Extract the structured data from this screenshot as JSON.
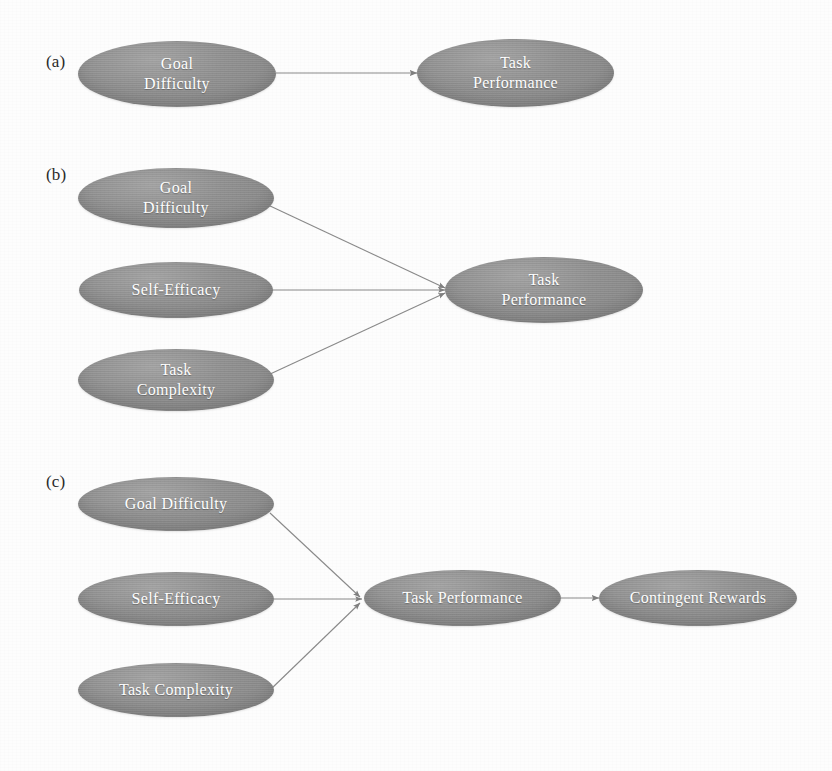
{
  "figure": {
    "background_color": "#fdfdfd",
    "node_fill_color": "#8d8d8d",
    "node_text_color": "#ffffff",
    "edge_color": "#8a8a8a",
    "panel_label_color": "#2a2a2a"
  },
  "panels": [
    {
      "label": "(a)",
      "nodes": [
        {
          "id": "a-goal-difficulty",
          "text": "Goal\nDifficulty"
        },
        {
          "id": "a-task-performance",
          "text": "Task\nPerformance"
        }
      ],
      "edges": [
        {
          "from": "Goal Difficulty",
          "to": "Task Performance"
        }
      ]
    },
    {
      "label": "(b)",
      "nodes": [
        {
          "id": "b-goal-difficulty",
          "text": "Goal\nDifficulty"
        },
        {
          "id": "b-self-efficacy",
          "text": "Self-Efficacy"
        },
        {
          "id": "b-task-complexity",
          "text": "Task\nComplexity"
        },
        {
          "id": "b-task-performance",
          "text": "Task\nPerformance"
        }
      ],
      "edges": [
        {
          "from": "Goal Difficulty",
          "to": "Task Performance"
        },
        {
          "from": "Self-Efficacy",
          "to": "Task Performance"
        },
        {
          "from": "Task Complexity",
          "to": "Task Performance"
        }
      ]
    },
    {
      "label": "(c)",
      "nodes": [
        {
          "id": "c-goal-difficulty",
          "text": "Goal Difficulty"
        },
        {
          "id": "c-self-efficacy",
          "text": "Self-Efficacy"
        },
        {
          "id": "c-task-complexity",
          "text": "Task Complexity"
        },
        {
          "id": "c-task-performance",
          "text": "Task Performance"
        },
        {
          "id": "c-contingent-rewards",
          "text": "Contingent Rewards"
        }
      ],
      "edges": [
        {
          "from": "Goal Difficulty",
          "to": "Task Performance"
        },
        {
          "from": "Self-Efficacy",
          "to": "Task Performance"
        },
        {
          "from": "Task Complexity",
          "to": "Task Performance"
        },
        {
          "from": "Task Performance",
          "to": "Contingent Rewards"
        }
      ]
    }
  ]
}
